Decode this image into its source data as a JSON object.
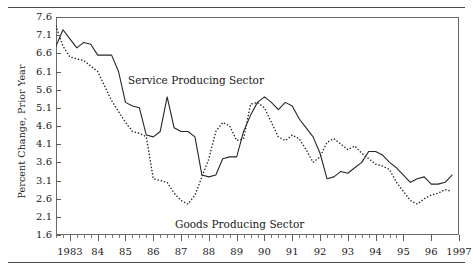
{
  "chart_data": {
    "type": "line",
    "title": "",
    "xlabel": "",
    "ylabel": "Percent Change, Prior Year",
    "xlim": [
      1982.5,
      1997.0
    ],
    "ylim": [
      1.6,
      7.6
    ],
    "grid": false,
    "legend_position": "inline-annotation",
    "y_ticks": [
      1.6,
      2.1,
      2.6,
      3.1,
      3.6,
      4.1,
      4.6,
      5.1,
      5.6,
      6.1,
      6.6,
      7.1,
      7.6
    ],
    "y_tick_labels": [
      "1.6",
      "2.1",
      "2.6",
      "3.1",
      "3.6",
      "4.1",
      "4.6",
      "5.1",
      "5.6",
      "6.1",
      "6.6",
      "7.1",
      "7.6"
    ],
    "x_ticks": [
      1983,
      1984,
      1985,
      1986,
      1987,
      1988,
      1989,
      1990,
      1991,
      1992,
      1993,
      1994,
      1995,
      1996,
      1997
    ],
    "x_tick_labels": [
      "1983",
      "84",
      "85",
      "86",
      "87",
      "88",
      "89",
      "90",
      "91",
      "92",
      "93",
      "94",
      "95",
      "96",
      "1997"
    ],
    "x_minor_ticks_per_interval": 4,
    "series": [
      {
        "name": "Service Producing Sector",
        "style": "solid",
        "color": "#262626",
        "x": [
          1982.5,
          1982.75,
          1983.0,
          1983.25,
          1983.5,
          1983.75,
          1984.0,
          1984.25,
          1984.5,
          1984.75,
          1985.0,
          1985.25,
          1985.5,
          1985.75,
          1986.0,
          1986.25,
          1986.5,
          1986.75,
          1987.0,
          1987.25,
          1987.5,
          1987.75,
          1988.0,
          1988.25,
          1988.5,
          1988.75,
          1989.0,
          1989.25,
          1989.5,
          1989.75,
          1990.0,
          1990.25,
          1990.5,
          1990.75,
          1991.0,
          1991.25,
          1991.5,
          1991.75,
          1992.0,
          1992.25,
          1992.5,
          1992.75,
          1993.0,
          1993.25,
          1993.5,
          1993.75,
          1994.0,
          1994.25,
          1994.5,
          1994.75,
          1995.0,
          1995.25,
          1995.5,
          1995.75,
          1996.0,
          1996.25,
          1996.5,
          1996.75
        ],
        "y": [
          6.8,
          7.25,
          7.0,
          6.75,
          6.9,
          6.85,
          6.55,
          6.55,
          6.55,
          6.1,
          5.25,
          5.15,
          5.1,
          4.35,
          4.3,
          4.45,
          5.4,
          4.55,
          4.45,
          4.45,
          4.3,
          3.25,
          3.2,
          3.25,
          3.7,
          3.75,
          3.75,
          4.45,
          4.9,
          5.25,
          5.4,
          5.25,
          5.05,
          5.25,
          5.15,
          4.8,
          4.55,
          4.3,
          3.85,
          3.15,
          3.2,
          3.35,
          3.3,
          3.45,
          3.6,
          3.9,
          3.9,
          3.8,
          3.6,
          3.45,
          3.25,
          3.05,
          3.15,
          3.2,
          3.0,
          3.0,
          3.05,
          3.25
        ]
      },
      {
        "name": "Goods Producing Sector",
        "style": "dotted",
        "color": "#262626",
        "x": [
          1982.5,
          1982.75,
          1983.0,
          1983.25,
          1983.5,
          1983.75,
          1984.0,
          1984.25,
          1984.5,
          1984.75,
          1985.0,
          1985.25,
          1985.5,
          1985.75,
          1986.0,
          1986.25,
          1986.5,
          1986.75,
          1987.0,
          1987.25,
          1987.5,
          1987.75,
          1988.0,
          1988.25,
          1988.5,
          1988.75,
          1989.0,
          1989.25,
          1989.5,
          1989.75,
          1990.0,
          1990.25,
          1990.5,
          1990.75,
          1991.0,
          1991.25,
          1991.5,
          1991.75,
          1992.0,
          1992.25,
          1992.5,
          1992.75,
          1993.0,
          1993.25,
          1993.5,
          1993.75,
          1994.0,
          1994.25,
          1994.5,
          1994.75,
          1995.0,
          1995.25,
          1995.5,
          1995.75,
          1996.0,
          1996.25,
          1996.5,
          1996.75
        ],
        "y": [
          7.35,
          6.8,
          6.5,
          6.45,
          6.4,
          6.25,
          6.1,
          5.7,
          5.3,
          5.0,
          4.7,
          4.45,
          4.4,
          4.3,
          3.15,
          3.1,
          3.05,
          2.75,
          2.55,
          2.45,
          2.7,
          3.2,
          3.7,
          4.45,
          4.7,
          4.6,
          4.2,
          4.25,
          5.2,
          5.25,
          5.1,
          4.7,
          4.3,
          4.2,
          4.35,
          4.25,
          3.95,
          3.6,
          3.75,
          4.15,
          4.25,
          4.1,
          3.95,
          4.05,
          3.85,
          3.7,
          3.55,
          3.5,
          3.4,
          3.05,
          2.8,
          2.55,
          2.45,
          2.6,
          2.7,
          2.75,
          2.85,
          2.8
        ]
      }
    ],
    "annotations": [
      {
        "text": "Service Producing Sector",
        "x": 1986.1,
        "y": 5.75
      },
      {
        "text": "Goods Producing Sector",
        "x": 1987.4,
        "y": 2.1
      }
    ]
  },
  "axes": {
    "y_title": "Percent Change, Prior Year",
    "y_tick_labels": [
      "7.6",
      "7.1",
      "6.6",
      "6.1",
      "5.6",
      "5.1",
      "4.6",
      "4.1",
      "3.6",
      "3.1",
      "2.6",
      "2.1",
      "1.6"
    ],
    "x_tick_labels": [
      "1983",
      "84",
      "85",
      "86",
      "87",
      "88",
      "89",
      "90",
      "91",
      "92",
      "93",
      "94",
      "95",
      "96",
      "1997"
    ]
  },
  "labels": {
    "service": "Service Producing Sector",
    "goods": "Goods Producing Sector"
  },
  "colors": {
    "line": "#262626",
    "frame": "#6b6b6b",
    "rule": "#4a4a4a",
    "background": "#ffffff"
  }
}
